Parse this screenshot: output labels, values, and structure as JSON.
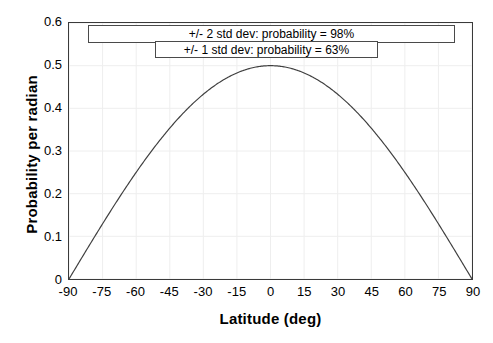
{
  "chart_data": {
    "type": "line",
    "title": "",
    "xlabel": "Latitude (deg)",
    "ylabel": "Probability per radian",
    "xlim": [
      -90,
      90
    ],
    "ylim": [
      0,
      0.6
    ],
    "xticks": [
      "-90",
      "-75",
      "-60",
      "-45",
      "-30",
      "-15",
      "0",
      "15",
      "30",
      "45",
      "60",
      "75",
      "90"
    ],
    "xtick_values": [
      -90,
      -75,
      -60,
      -45,
      -30,
      -15,
      0,
      15,
      30,
      45,
      60,
      75,
      90
    ],
    "yticks": [
      "0",
      "0.1",
      "0.2",
      "0.3",
      "0.4",
      "0.5",
      "0.6"
    ],
    "ytick_values": [
      0,
      0.1,
      0.2,
      0.3,
      0.4,
      0.5,
      0.6
    ],
    "grid": true,
    "legend": "none",
    "series": [
      {
        "name": "Probability density",
        "color": "#404040",
        "x": [
          -90,
          -85,
          -80,
          -75,
          -70,
          -65,
          -60,
          -55,
          -50,
          -45,
          -40,
          -35,
          -30,
          -25,
          -20,
          -15,
          -10,
          -5,
          0,
          5,
          10,
          15,
          20,
          25,
          30,
          35,
          40,
          45,
          50,
          55,
          60,
          65,
          70,
          75,
          80,
          85,
          90
        ],
        "values": [
          0.0,
          0.0436,
          0.0868,
          0.1294,
          0.171,
          0.2113,
          0.25,
          0.2868,
          0.3214,
          0.3536,
          0.383,
          0.4096,
          0.433,
          0.4532,
          0.4698,
          0.483,
          0.4924,
          0.4981,
          0.5,
          0.4981,
          0.4924,
          0.483,
          0.4698,
          0.4532,
          0.433,
          0.4096,
          0.383,
          0.3536,
          0.3214,
          0.2868,
          0.25,
          0.2113,
          0.171,
          0.1294,
          0.0868,
          0.0436,
          0.0
        ]
      }
    ],
    "annotations": [
      {
        "text": "+/- 2 std dev: probability = 98%"
      },
      {
        "text": "+/- 1 std dev: probability = 63%"
      }
    ]
  },
  "axes": {
    "x_title": "Latitude (deg)",
    "y_title": "Probability per radian"
  },
  "colors": {
    "curve": "#404040",
    "frame": "#3a3a3a",
    "grid": "#eeeeee",
    "box_border": "#4a4a4a",
    "background": "#ffffff"
  }
}
